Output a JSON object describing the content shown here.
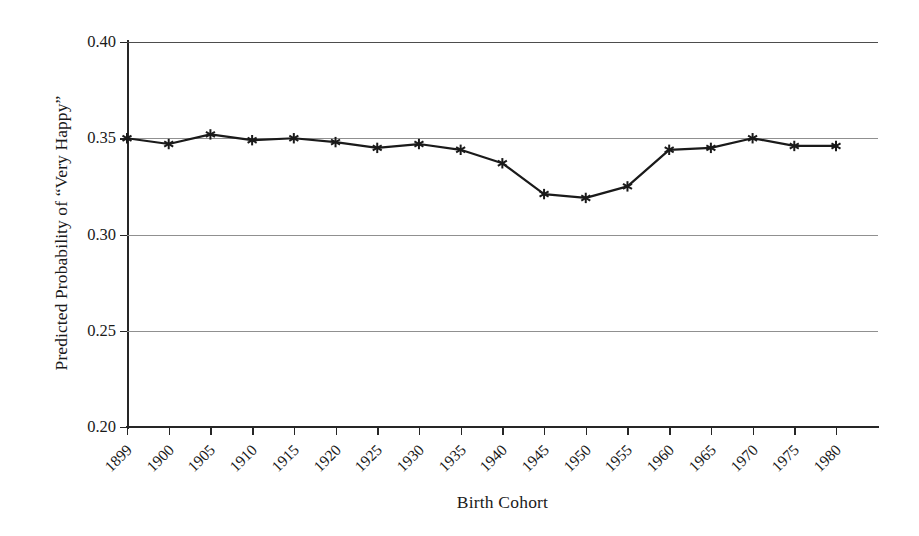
{
  "chart_data": {
    "type": "line",
    "title": "",
    "xlabel": "Birth Cohort",
    "ylabel": "Predicted Probability of “Very Happy”",
    "categories": [
      "1899",
      "1900",
      "1905",
      "1910",
      "1915",
      "1920",
      "1925",
      "1930",
      "1935",
      "1940",
      "1945",
      "1950",
      "1955",
      "1960",
      "1965",
      "1970",
      "1975",
      "1980"
    ],
    "values": [
      0.35,
      0.347,
      0.352,
      0.349,
      0.35,
      0.348,
      0.345,
      0.347,
      0.344,
      0.337,
      0.321,
      0.319,
      0.325,
      0.344,
      0.345,
      0.35,
      0.346,
      0.346
    ],
    "series": [
      {
        "name": "Predicted Probability of “Very Happy”",
        "values": [
          0.35,
          0.347,
          0.352,
          0.349,
          0.35,
          0.348,
          0.345,
          0.347,
          0.344,
          0.337,
          0.321,
          0.319,
          0.325,
          0.344,
          0.345,
          0.35,
          0.346,
          0.346
        ]
      }
    ],
    "ylim": [
      0.2,
      0.4
    ],
    "yticks": [
      0.2,
      0.25,
      0.3,
      0.35,
      0.4
    ],
    "ytick_labels": [
      "0.20",
      "0.25",
      "0.30",
      "0.35",
      "0.40"
    ],
    "grid": "horizontal",
    "legend": "none",
    "marker": "star",
    "line_color": "#1a1a1a",
    "grid_color": "#909090",
    "axis_color": "#262626",
    "background_color": "#ffffff",
    "xtick_rotation": -45
  }
}
